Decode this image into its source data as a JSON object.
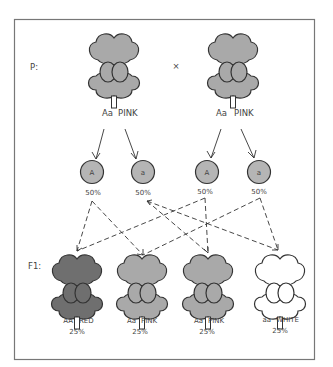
{
  "diagram": {
    "generation_labels": {
      "parental": "P:",
      "filial": "F1:"
    },
    "cross_symbol": "×",
    "parents": [
      {
        "genotype": "Aa",
        "phenotype": "PINK",
        "color": "#a9a9a9"
      },
      {
        "genotype": "Aa",
        "phenotype": "PINK",
        "color": "#a9a9a9"
      }
    ],
    "gametes": [
      {
        "allele": "A",
        "percent": "50%"
      },
      {
        "allele": "a",
        "percent": "50%"
      },
      {
        "allele": "A",
        "percent": "50%"
      },
      {
        "allele": "a",
        "percent": "50%"
      }
    ],
    "offspring": [
      {
        "genotype": "AA",
        "phenotype": "RED",
        "percent": "25%",
        "color": "#6f6f6f"
      },
      {
        "genotype": "Aa",
        "phenotype": "PINK",
        "percent": "25%",
        "color": "#a9a9a9"
      },
      {
        "genotype": "Aa",
        "phenotype": "PINK",
        "percent": "25%",
        "color": "#a9a9a9"
      },
      {
        "genotype": "aa",
        "phenotype": "WHITE",
        "percent": "25%",
        "color": "#ffffff"
      }
    ],
    "colors": {
      "border": "#777777",
      "stroke": "#333333",
      "gamete_fill": "#b5b5b5"
    }
  }
}
